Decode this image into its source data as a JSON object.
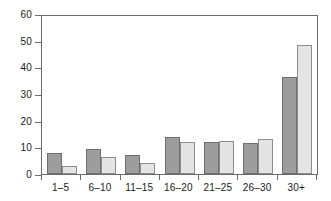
{
  "chart_data": {
    "type": "bar",
    "title": "",
    "subtitle": "",
    "xlabel": "",
    "ylabel": "",
    "categories": [
      "1–5",
      "6–10",
      "11–15",
      "16–20",
      "21–25",
      "26–30",
      "30+"
    ],
    "series": [
      {
        "name": "Series 1",
        "color": "#9d9d9d",
        "values": [
          8,
          9.5,
          7,
          14,
          12,
          11.5,
          36.5
        ]
      },
      {
        "name": "Series 2",
        "color": "#e4e4e4",
        "values": [
          3,
          6.5,
          4,
          12,
          12.5,
          13,
          48.5
        ]
      }
    ],
    "ylim": [
      0,
      60
    ],
    "yticks": [
      0,
      10,
      20,
      30,
      40,
      50,
      60
    ],
    "ytick_labels": [
      "0",
      "10",
      "20",
      "30",
      "40",
      "50",
      "60"
    ],
    "grid": false,
    "legend": "none",
    "axis_color": "#6b6b6b",
    "plot_background": "#ffffff"
  }
}
